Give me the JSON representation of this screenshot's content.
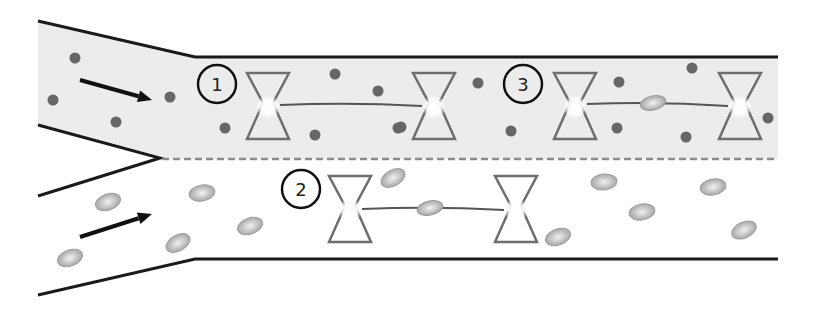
{
  "diagram": {
    "type": "microfluidic-channel-schematic",
    "colors": {
      "upper_channel_fill": "#ececec",
      "lower_channel_fill": "#ffffff",
      "wall": "#1a1a1a",
      "dashed_interface": "#8a8a8a",
      "dot_particle": "#666666",
      "ellipse_particle": "#b5b5b5",
      "trap_outline": "#6e6e6e",
      "tether": "#555555"
    },
    "labels": [
      {
        "id": "step-1",
        "text": "1",
        "x": 217,
        "y": 84
      },
      {
        "id": "step-2",
        "text": "2",
        "x": 301,
        "y": 189
      },
      {
        "id": "step-3",
        "text": "3",
        "x": 523,
        "y": 84
      }
    ],
    "flow_arrows": [
      {
        "id": "arrow-upper",
        "x1": 80,
        "y1": 80,
        "x2": 152,
        "y2": 100
      },
      {
        "id": "arrow-lower",
        "x1": 80,
        "y1": 237,
        "x2": 152,
        "y2": 214
      }
    ],
    "traps": [
      {
        "pair": 1,
        "x": 268,
        "y": 107
      },
      {
        "pair": 1,
        "x": 434,
        "y": 107
      },
      {
        "pair": 2,
        "x": 350,
        "y": 210
      },
      {
        "pair": 2,
        "x": 516,
        "y": 210
      },
      {
        "pair": 3,
        "x": 575,
        "y": 107
      },
      {
        "pair": 3,
        "x": 740,
        "y": 107
      }
    ],
    "tethers": [
      {
        "pair": 1,
        "x1": 280,
        "y1": 105,
        "x2": 422,
        "y2": 106,
        "bead": false
      },
      {
        "pair": 2,
        "x1": 362,
        "y1": 209,
        "x2": 504,
        "y2": 210,
        "bead": true,
        "bead_x": 430,
        "bead_y": 208
      },
      {
        "pair": 3,
        "x1": 587,
        "y1": 104,
        "x2": 728,
        "y2": 106,
        "bead": true,
        "bead_x": 653,
        "bead_y": 103
      }
    ],
    "dots": [
      [
        75,
        58
      ],
      [
        53,
        100
      ],
      [
        116,
        122
      ],
      [
        170,
        97
      ],
      [
        225,
        128
      ],
      [
        335,
        74
      ],
      [
        378,
        91
      ],
      [
        398,
        128
      ],
      [
        315,
        135
      ],
      [
        478,
        83
      ],
      [
        401,
        127
      ],
      [
        511,
        131
      ],
      [
        619,
        82
      ],
      [
        617,
        128
      ],
      [
        686,
        137
      ],
      [
        692,
        68
      ],
      [
        768,
        118
      ]
    ],
    "ellipses": [
      [
        108,
        202,
        -20
      ],
      [
        202,
        193,
        -10
      ],
      [
        70,
        258,
        -20
      ],
      [
        178,
        243,
        -30
      ],
      [
        250,
        226,
        -20
      ],
      [
        393,
        178,
        -30
      ],
      [
        604,
        182,
        -5
      ],
      [
        713,
        187,
        -10
      ],
      [
        642,
        212,
        -10
      ],
      [
        558,
        237,
        -20
      ],
      [
        744,
        230,
        -25
      ]
    ]
  }
}
